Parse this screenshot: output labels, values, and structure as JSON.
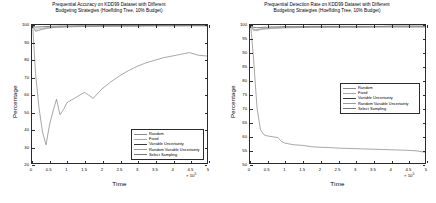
{
  "figure": {
    "background": "#ffffff",
    "axis_color": "#2b2b2b"
  },
  "panels": [
    {
      "id": "prequential-accuracy",
      "title_line1": "Prequential Accuracy on KDD99 Dataset with Different",
      "title_line2": "Budgeting Strategies (Hoeffding Tree, 10% Budget)",
      "ylabel": "Percentage",
      "xlabel": "Time",
      "exponent": "10",
      "exponent_power": "5",
      "exponent_prefix": "× ",
      "yticks": [
        "20",
        "30",
        "40",
        "50",
        "60",
        "70",
        "80",
        "90",
        "100"
      ],
      "xticks": [
        "0",
        "0.5",
        "1",
        "1.5",
        "2",
        "2.5",
        "3",
        "3.5",
        "4",
        "4.5",
        "5"
      ],
      "legend": [
        {
          "label": "Random",
          "color": "#8a8a8a"
        },
        {
          "label": "Fixed",
          "color": "#a8a8a8"
        },
        {
          "label": "Variable Uncertainty",
          "color": "#3a3a3a"
        },
        {
          "label": "Random Variable Uncertainty",
          "color": "#9b9b9b"
        },
        {
          "label": "Select Sampling",
          "color": "#777777"
        }
      ]
    },
    {
      "id": "prequential-detection-rate",
      "title_line1": "Prequential Detection Rate on KDD99 Dataset with Different",
      "title_line2": "Budgeting Strategies (Hoeffding Tree, 10% Budget)",
      "ylabel": "Percentage",
      "xlabel": "Time",
      "exponent": "10",
      "exponent_power": "5",
      "exponent_prefix": "× ",
      "yticks": [
        "50",
        "55",
        "60",
        "65",
        "70",
        "75",
        "80",
        "85",
        "90",
        "95",
        "100"
      ],
      "xticks": [
        "0",
        "0.5",
        "1",
        "1.5",
        "2",
        "2.5",
        "3",
        "3.5",
        "4",
        "4.5",
        "5"
      ],
      "legend": [
        {
          "label": "Random",
          "color": "#8a8a8a"
        },
        {
          "label": "Fixed",
          "color": "#a8a8a8"
        },
        {
          "label": "Variable Uncertainty",
          "color": "#3a3a3a"
        },
        {
          "label": "Random Variable Uncertainty",
          "color": "#9b9b9b"
        },
        {
          "label": "Select Sampling",
          "color": "#777777"
        }
      ]
    }
  ],
  "chart_data": [
    {
      "type": "line",
      "title": "Prequential Accuracy on KDD99 Dataset with Different Budgeting Strategies (Hoeffding Tree, 10% Budget)",
      "xlabel": "Time",
      "ylabel": "Percentage",
      "x_scale_exponent": 5,
      "xlim": [
        0,
        5
      ],
      "ylim": [
        20,
        100
      ],
      "grid": false,
      "legend_position": "lower-right",
      "x": [
        0.02,
        0.1,
        0.2,
        0.3,
        0.4,
        0.5,
        0.6,
        0.7,
        0.8,
        0.9,
        1.0,
        1.25,
        1.5,
        1.75,
        2.0,
        2.25,
        2.5,
        2.75,
        3.0,
        3.25,
        3.5,
        3.75,
        4.0,
        4.25,
        4.5,
        4.75,
        5.0
      ],
      "series": [
        {
          "name": "Random",
          "color": "#8a8a8a",
          "values": [
            99.5,
            96.5,
            97.0,
            97.6,
            98.0,
            98.3,
            98.5,
            98.7,
            98.8,
            98.9,
            99.0,
            99.1,
            99.2,
            99.2,
            99.3,
            99.3,
            99.4,
            99.4,
            99.4,
            99.5,
            99.5,
            99.5,
            99.5,
            99.5,
            99.6,
            99.6,
            99.6
          ]
        },
        {
          "name": "Fixed",
          "color": "#a8a8a8",
          "values": [
            99.4,
            96.2,
            96.9,
            97.5,
            97.9,
            98.2,
            98.4,
            98.6,
            98.7,
            98.8,
            98.9,
            99.0,
            99.1,
            99.2,
            99.2,
            99.3,
            99.3,
            99.4,
            99.4,
            99.4,
            99.5,
            99.5,
            99.5,
            99.5,
            99.5,
            99.5,
            99.5
          ]
        },
        {
          "name": "Variable Uncertainty",
          "color": "#3a3a3a",
          "values": [
            99.6,
            98.8,
            98.9,
            99.0,
            99.1,
            99.2,
            99.3,
            99.3,
            99.4,
            99.4,
            99.4,
            99.5,
            99.5,
            99.5,
            99.6,
            99.6,
            99.6,
            99.6,
            99.6,
            99.7,
            99.7,
            99.7,
            99.7,
            99.7,
            99.7,
            99.7,
            99.7
          ]
        },
        {
          "name": "Random Variable Uncertainty",
          "color": "#9b9b9b",
          "values": [
            99.5,
            97.5,
            97.8,
            98.1,
            98.4,
            98.6,
            98.7,
            98.8,
            98.9,
            99.0,
            99.1,
            99.2,
            99.3,
            99.3,
            99.4,
            99.4,
            99.4,
            99.5,
            99.5,
            99.5,
            99.5,
            99.6,
            99.6,
            99.6,
            99.6,
            99.6,
            99.6
          ]
        },
        {
          "name": "Select Sampling",
          "color": "#777777",
          "values": [
            99.8,
            72.0,
            52.0,
            38.0,
            30.5,
            42.0,
            50.0,
            57.0,
            48.0,
            51.0,
            55.0,
            58.0,
            61.0,
            57.5,
            63.0,
            67.0,
            70.5,
            73.5,
            76.0,
            78.0,
            79.5,
            81.0,
            82.0,
            83.0,
            84.0,
            82.5,
            82.0
          ]
        }
      ]
    },
    {
      "type": "line",
      "title": "Prequential Detection Rate on KDD99 Dataset with Different Budgeting Strategies (Hoeffding Tree, 10% Budget)",
      "xlabel": "Time",
      "ylabel": "Percentage",
      "x_scale_exponent": 5,
      "xlim": [
        0,
        5
      ],
      "ylim": [
        50,
        100
      ],
      "grid": false,
      "legend_position": "center-right",
      "x": [
        0.02,
        0.1,
        0.2,
        0.3,
        0.4,
        0.5,
        0.6,
        0.7,
        0.8,
        0.9,
        1.0,
        1.25,
        1.5,
        1.75,
        2.0,
        2.25,
        2.5,
        2.75,
        3.0,
        3.25,
        3.5,
        3.75,
        4.0,
        4.25,
        4.5,
        4.75,
        5.0
      ],
      "series": [
        {
          "name": "Random",
          "color": "#8a8a8a",
          "values": [
            99.9,
            98.3,
            97.9,
            98.4,
            98.6,
            98.7,
            98.8,
            98.9,
            98.9,
            99.0,
            99.0,
            99.1,
            99.1,
            99.1,
            99.2,
            99.2,
            99.2,
            99.2,
            99.2,
            99.2,
            99.3,
            99.3,
            99.3,
            99.3,
            99.3,
            99.3,
            99.3
          ]
        },
        {
          "name": "Fixed",
          "color": "#a8a8a8",
          "values": [
            99.9,
            97.8,
            98.4,
            98.3,
            98.5,
            98.6,
            98.7,
            98.8,
            98.9,
            98.9,
            99.0,
            99.0,
            99.1,
            99.1,
            99.1,
            99.2,
            99.2,
            99.2,
            99.2,
            99.2,
            99.2,
            99.3,
            99.3,
            99.3,
            99.3,
            99.3,
            99.3
          ]
        },
        {
          "name": "Variable Uncertainty",
          "color": "#3a3a3a",
          "values": [
            99.9,
            99.2,
            99.0,
            99.1,
            99.2,
            99.2,
            99.3,
            99.3,
            99.3,
            99.4,
            99.4,
            99.4,
            99.4,
            99.5,
            99.5,
            99.5,
            99.5,
            99.5,
            99.5,
            99.5,
            99.5,
            99.5,
            99.6,
            99.6,
            99.6,
            99.6,
            99.6
          ]
        },
        {
          "name": "Random Variable Uncertainty",
          "color": "#9b9b9b",
          "values": [
            99.9,
            98.6,
            98.2,
            98.7,
            98.8,
            98.9,
            99.0,
            99.0,
            99.1,
            99.1,
            99.1,
            99.2,
            99.2,
            99.2,
            99.3,
            99.3,
            99.3,
            99.3,
            99.3,
            99.3,
            99.4,
            99.4,
            99.4,
            99.4,
            99.4,
            99.4,
            99.4
          ]
        },
        {
          "name": "Select Sampling",
          "color": "#777777",
          "values": [
            99.9,
            88.0,
            70.0,
            62.0,
            60.2,
            59.8,
            59.6,
            59.4,
            59.2,
            57.8,
            57.2,
            56.6,
            56.4,
            55.9,
            55.7,
            55.6,
            55.4,
            55.3,
            55.2,
            55.1,
            55.0,
            54.9,
            54.8,
            54.7,
            54.6,
            54.4,
            53.9
          ]
        }
      ]
    }
  ]
}
